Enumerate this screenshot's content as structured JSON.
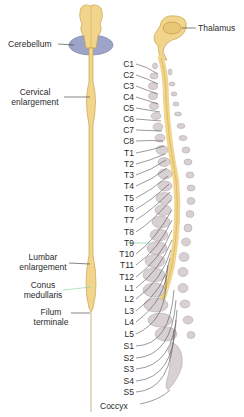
{
  "diagram": {
    "left_labels": {
      "cerebellum": "Cerebellum",
      "cervical_enlargement": [
        "Cervical",
        "enlargement"
      ],
      "lumbar_enlargement": [
        "Lumbar",
        "enlargement"
      ],
      "conus_medullaris": [
        "Conus",
        "medullaris"
      ],
      "filum_terminale": [
        "Filum",
        "terminale"
      ]
    },
    "right_labels": {
      "thalamus": "Thalamus"
    },
    "segments": [
      "C1",
      "C2",
      "C3",
      "C4",
      "C5",
      "C6",
      "C7",
      "C8",
      "T1",
      "T2",
      "T3",
      "T4",
      "T5",
      "T6",
      "T7",
      "T8",
      "T9",
      "T10",
      "T11",
      "T12",
      "L1",
      "L2",
      "L3",
      "L4",
      "L5",
      "S1",
      "S2",
      "S3",
      "S4",
      "S5"
    ],
    "coccyx_label": "Coccyx",
    "colors": {
      "cord": "#f1d58c",
      "cord_edge": "#caa24e",
      "cerebellum": "#9ea3c8",
      "vertebra": "#d9d0d3",
      "vertebra_edge": "#a8a0a4",
      "nerve": "#555555",
      "highlight_line": "#7fd4a0"
    }
  }
}
